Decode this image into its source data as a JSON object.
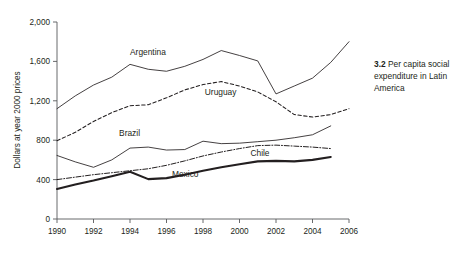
{
  "caption": {
    "number": "3.2",
    "text": "Per capita social expenditure in Latin America"
  },
  "chart_data": {
    "type": "line",
    "title": "",
    "xlabel": "",
    "ylabel": "Dollars at year 2000 prices",
    "xlim": [
      1990,
      2006
    ],
    "ylim": [
      0,
      2000
    ],
    "grid": false,
    "legend_position": "inline-labels",
    "x_ticks": [
      "1990",
      "1992",
      "1994",
      "1996",
      "1998",
      "2000",
      "2002",
      "2004",
      "2006"
    ],
    "x_tick_values": [
      1990,
      1992,
      1994,
      1996,
      1998,
      2000,
      2002,
      2004,
      2006
    ],
    "y_ticks": [
      "0",
      "400",
      "800",
      "1,200",
      "1,600",
      "2,000"
    ],
    "y_tick_values": [
      0,
      400,
      800,
      1200,
      1600,
      2000
    ],
    "x": [
      1990,
      1991,
      1992,
      1993,
      1994,
      1995,
      1996,
      1997,
      1998,
      1999,
      2000,
      2001,
      2002,
      2003,
      2004,
      2005,
      2006
    ],
    "series": [
      {
        "name": "Argentina",
        "style": "thin-solid",
        "label_x": 1994.0,
        "label_y": 1660,
        "x": [
          1990,
          1991,
          1992,
          1993,
          1994,
          1995,
          1996,
          1997,
          1998,
          1999,
          2000,
          2001,
          2002,
          2003,
          2004,
          2005,
          2006
        ],
        "values": [
          1120,
          1250,
          1360,
          1440,
          1570,
          1520,
          1500,
          1550,
          1620,
          1710,
          1660,
          1605,
          1270,
          1350,
          1430,
          1590,
          1800
        ]
      },
      {
        "name": "Uruguay",
        "style": "dashed",
        "label_x": 1998.1,
        "label_y": 1255,
        "x": [
          1990,
          1991,
          1992,
          1993,
          1994,
          1995,
          1996,
          1997,
          1998,
          1999,
          2000,
          2001,
          2002,
          2003,
          2004,
          2005,
          2006
        ],
        "values": [
          795,
          880,
          990,
          1080,
          1150,
          1160,
          1230,
          1310,
          1365,
          1395,
          1350,
          1290,
          1190,
          1060,
          1035,
          1060,
          1120
        ]
      },
      {
        "name": "Brazil",
        "style": "thin-solid",
        "label_x": 1993.4,
        "label_y": 845,
        "x": [
          1990,
          1991,
          1992,
          1993,
          1994,
          1995,
          1996,
          1997,
          1998,
          1999,
          2000,
          2001,
          2002,
          2003,
          2004,
          2005
        ],
        "values": [
          645,
          580,
          525,
          600,
          720,
          730,
          700,
          705,
          790,
          765,
          770,
          785,
          800,
          825,
          855,
          945
        ]
      },
      {
        "name": "Chile",
        "style": "dash-dot",
        "label_x": 2000.6,
        "label_y": 640,
        "x": [
          1990,
          1991,
          1992,
          1993,
          1994,
          1995,
          1996,
          1997,
          1998,
          1999,
          2000,
          2001,
          2002,
          2003,
          2004,
          2005
        ],
        "values": [
          400,
          425,
          450,
          470,
          490,
          510,
          545,
          590,
          640,
          680,
          715,
          745,
          750,
          740,
          730,
          715
        ]
      },
      {
        "name": "Mexico",
        "style": "thick-solid",
        "label_x": 1996.3,
        "label_y": 425,
        "x": [
          1990,
          1991,
          1992,
          1993,
          1994,
          1995,
          1996,
          1997,
          1998,
          1999,
          2000,
          2001,
          2002,
          2003,
          2004,
          2005
        ],
        "values": [
          305,
          350,
          390,
          435,
          480,
          405,
          415,
          450,
          490,
          525,
          555,
          585,
          590,
          585,
          600,
          630
        ]
      }
    ]
  }
}
